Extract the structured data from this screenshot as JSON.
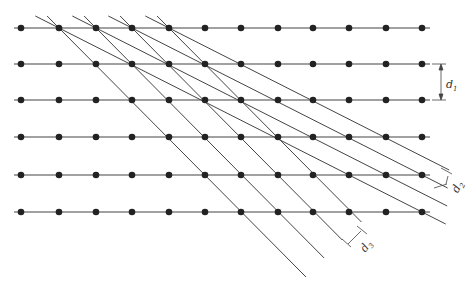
{
  "diagram": {
    "type": "crystal-lattice-planes",
    "colors": {
      "atom": "#222222",
      "line": "#444444",
      "background": "#ffffff"
    },
    "lattice": {
      "rows_y": [
        28,
        64,
        100,
        137,
        175,
        212
      ],
      "cols_x": [
        21,
        59,
        96,
        132,
        169,
        205,
        241,
        278,
        313,
        349,
        386,
        422
      ],
      "row_line_x_range": [
        14,
        430
      ]
    },
    "labels": {
      "d1": {
        "main": "d",
        "sub": "1"
      },
      "d2": {
        "main": "d",
        "sub": "2"
      },
      "d3": {
        "main": "d",
        "sub": "3"
      }
    }
  }
}
